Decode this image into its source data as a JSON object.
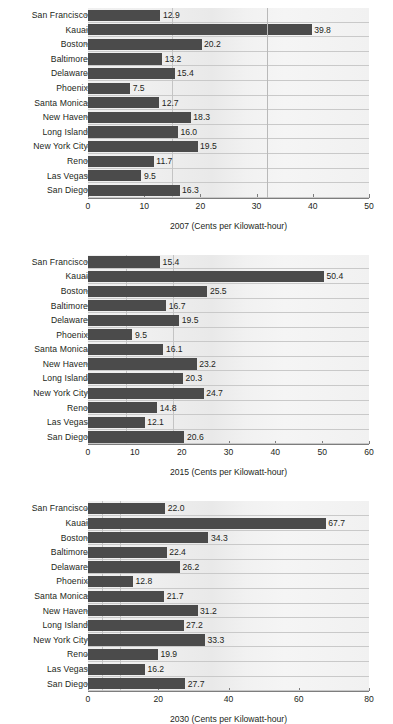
{
  "figure": {
    "title": "",
    "background": "#ffffff",
    "bar_color": "#4b4b4b",
    "grid_color": "#c9c9c9",
    "axis_color": "#7d7d7d",
    "text_color": "#231f20"
  },
  "chart_data": [
    {
      "type": "bar",
      "orientation": "horizontal",
      "title": "",
      "xlabel": "2007 (Cents per Kilowatt-hour)",
      "ylabel": "",
      "xlim": [
        0,
        50
      ],
      "xticks": [
        0,
        10,
        20,
        30,
        40,
        50
      ],
      "xticklabels": [
        "0",
        "10",
        "20",
        "30",
        "40",
        "50"
      ],
      "grid": true,
      "gridlines_x": [
        15.0,
        31.8
      ],
      "legend": "none",
      "categories": [
        "San Francisco",
        "Kauai",
        "Boston",
        "Baltimore",
        "Delaware",
        "Phoenix",
        "Santa Monica",
        "New Haven",
        "Long Island",
        "New York City",
        "Reno",
        "Las Vegas",
        "San Diego"
      ],
      "values": [
        12.9,
        39.8,
        20.2,
        13.2,
        15.4,
        7.5,
        12.7,
        18.3,
        16.0,
        19.5,
        11.7,
        9.5,
        16.3
      ],
      "value_labels": [
        "12.9",
        "39.8",
        "20.2",
        "13.2",
        "15.4",
        "7.5",
        "12.7",
        "18.3",
        "16.0",
        "19.5",
        "11.7",
        "9.5",
        "16.3"
      ]
    },
    {
      "type": "bar",
      "orientation": "horizontal",
      "title": "",
      "xlabel": "2015 (Cents per Kilowatt-hour)",
      "ylabel": "",
      "xlim": [
        0,
        60
      ],
      "xticks": [
        0,
        10,
        20,
        30,
        40,
        50,
        60
      ],
      "xticklabels": [
        "0",
        "10",
        "20",
        "30",
        "40",
        "50",
        "60"
      ],
      "grid": true,
      "gridlines_x": [
        8.2,
        18.2
      ],
      "legend": "none",
      "categories": [
        "San Francisco",
        "Kauai",
        "Boston",
        "Baltimore",
        "Delaware",
        "Phoenix",
        "Santa Monica",
        "New Haven",
        "Long Island",
        "New York City",
        "Reno",
        "Las Vegas",
        "San Diego"
      ],
      "values": [
        15.4,
        50.4,
        25.5,
        16.7,
        19.5,
        9.5,
        16.1,
        23.2,
        20.3,
        24.7,
        14.8,
        12.1,
        20.6
      ],
      "value_labels": [
        "15.4",
        "50.4",
        "25.5",
        "16.7",
        "19.5",
        "9.5",
        "16.1",
        "23.2",
        "20.3",
        "24.7",
        "14.8",
        "12.1",
        "20.6"
      ]
    },
    {
      "type": "bar",
      "orientation": "horizontal",
      "title": "",
      "xlabel": "2030 (Cents per Kilowatt-hour)",
      "ylabel": "",
      "xlim": [
        0,
        80
      ],
      "xticks": [
        0,
        20,
        40,
        60,
        80
      ],
      "xticklabels": [
        "0",
        "20",
        "40",
        "60",
        "80"
      ],
      "grid": true,
      "gridlines_x": [
        4.0,
        9.0
      ],
      "legend": "none",
      "categories": [
        "San Francisco",
        "Kauai",
        "Boston",
        "Baltimore",
        "Delaware",
        "Phoenix",
        "Santa Monica",
        "New Haven",
        "Long Island",
        "New York City",
        "Reno",
        "Las Vegas",
        "San Diego"
      ],
      "values": [
        22.0,
        67.7,
        34.3,
        22.4,
        26.2,
        12.8,
        21.7,
        31.2,
        27.2,
        33.3,
        19.9,
        16.2,
        27.7
      ],
      "value_labels": [
        "22.0",
        "67.7",
        "34.3",
        "22.4",
        "26.2",
        "12.8",
        "21.7",
        "31.2",
        "27.2",
        "33.3",
        "19.9",
        "16.2",
        "27.7"
      ]
    }
  ]
}
